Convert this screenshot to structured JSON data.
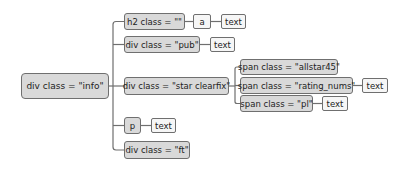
{
  "diagram": {
    "type": "tree",
    "root": {
      "id": "info",
      "label": "div class = \"info\""
    },
    "nodes": {
      "h2": {
        "label": "h2 class = \"\""
      },
      "h2_a": {
        "label": "a"
      },
      "h2_a_text": {
        "label": "text"
      },
      "pub": {
        "label": "div class = \"pub\""
      },
      "pub_text": {
        "label": "text"
      },
      "star": {
        "label": "div class = \"star clearfix\""
      },
      "allstar": {
        "label": "span class = \"allstar45\""
      },
      "rating": {
        "label": "span class = \"rating_nums\""
      },
      "rating_text": {
        "label": "text"
      },
      "pl": {
        "label": "span class = \"pl\""
      },
      "pl_text": {
        "label": "text"
      },
      "p": {
        "label": "p"
      },
      "p_text": {
        "label": "text"
      },
      "ft": {
        "label": "div class = \"ft\""
      }
    },
    "edges": [
      [
        "info",
        "h2"
      ],
      [
        "h2",
        "h2_a"
      ],
      [
        "h2_a",
        "h2_a_text"
      ],
      [
        "info",
        "pub"
      ],
      [
        "pub",
        "pub_text"
      ],
      [
        "info",
        "star"
      ],
      [
        "star",
        "allstar"
      ],
      [
        "star",
        "rating"
      ],
      [
        "rating",
        "rating_text"
      ],
      [
        "star",
        "pl"
      ],
      [
        "pl",
        "pl_text"
      ],
      [
        "info",
        "p"
      ],
      [
        "p",
        "p_text"
      ],
      [
        "info",
        "ft"
      ]
    ],
    "colors": {
      "node_fill": "#d9d9d9",
      "leaf_fill": "#f6f6f6",
      "border": "#6f6f6f",
      "background": "#ffffff"
    }
  }
}
